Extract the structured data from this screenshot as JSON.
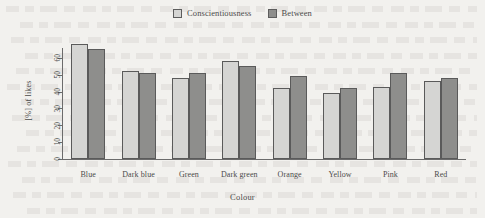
{
  "chart_data": {
    "type": "bar",
    "title": "",
    "xlabel": "Colour",
    "ylabel": "[%] of likes",
    "categories": [
      "Blue",
      "Dark blue",
      "Green",
      "Dark green",
      "Orange",
      "Yellow",
      "Pink",
      "Red"
    ],
    "series": [
      {
        "name": "Conscientiousness",
        "color": "#d5d5d3",
        "values": [
          68,
          52,
          48,
          58,
          42,
          39,
          43,
          46
        ]
      },
      {
        "name": "Between",
        "color": "#8e8e8c",
        "values": [
          65,
          51,
          51,
          55,
          49,
          42,
          51,
          48
        ]
      }
    ],
    "ylim": [
      0,
      70
    ],
    "yticks": [
      0,
      10,
      20,
      30,
      40,
      50,
      60
    ],
    "grid": false,
    "legend_position": "top-center"
  },
  "legend": {
    "items": [
      {
        "label": "Conscientiousness",
        "swatch": "#d5d5d3"
      },
      {
        "label": "Between",
        "swatch": "#8e8e8c"
      }
    ]
  }
}
